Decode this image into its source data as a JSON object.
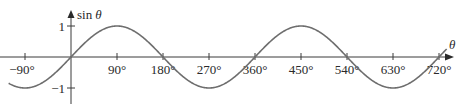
{
  "chart_data": {
    "type": "line",
    "title": "",
    "xlabel": "θ",
    "ylabel": "sin θ",
    "function": "sin",
    "x_unit": "degrees",
    "xlim": [
      -122,
      735
    ],
    "ylim": [
      -1,
      1
    ],
    "grid": false,
    "legend": "none",
    "x_ticks": [
      -90,
      90,
      180,
      270,
      360,
      450,
      540,
      630,
      720
    ],
    "x_tick_labels": [
      "−90°",
      "90°",
      "180°",
      "270°",
      "360°",
      "450°",
      "540°",
      "630°",
      "720°"
    ],
    "y_ticks": [
      1,
      -1
    ],
    "y_tick_labels": [
      "1",
      "−1"
    ],
    "key_points": [
      {
        "x": -90,
        "y": -1
      },
      {
        "x": 0,
        "y": 0
      },
      {
        "x": 90,
        "y": 1
      },
      {
        "x": 180,
        "y": 0
      },
      {
        "x": 270,
        "y": -1
      },
      {
        "x": 360,
        "y": 0
      },
      {
        "x": 450,
        "y": 1
      },
      {
        "x": 540,
        "y": 0
      },
      {
        "x": 630,
        "y": -1
      },
      {
        "x": 720,
        "y": 0
      }
    ],
    "series": [
      {
        "name": "sin θ",
        "color": "#6e6e6e"
      }
    ]
  },
  "colors": {
    "axis": "#3a3a3a",
    "curve": "#6e6e6e",
    "text": "#2a2a2a"
  }
}
